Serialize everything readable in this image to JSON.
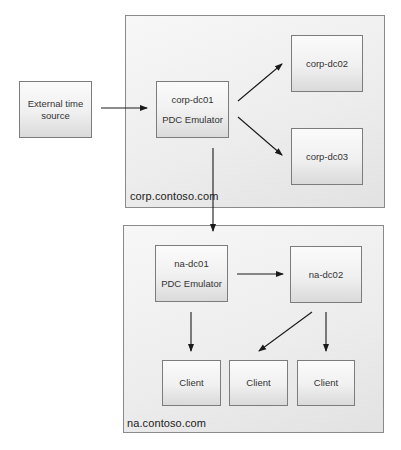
{
  "diagram": {
    "domains": [
      {
        "id": "corp",
        "label": "corp.contoso.com"
      },
      {
        "id": "na",
        "label": "na.contoso.com"
      }
    ],
    "nodes": {
      "external": {
        "line1": "External time",
        "line2": "source"
      },
      "corp_dc01": {
        "line1": "corp-dc01",
        "line2": "PDC Emulator"
      },
      "corp_dc02": {
        "line1": "corp-dc02"
      },
      "corp_dc03": {
        "line1": "corp-dc03"
      },
      "na_dc01": {
        "line1": "na-dc01",
        "line2": "PDC Emulator"
      },
      "na_dc02": {
        "line1": "na-dc02"
      },
      "client1": {
        "line1": "Client"
      },
      "client2": {
        "line1": "Client"
      },
      "client3": {
        "line1": "Client"
      }
    },
    "edges": [
      {
        "from": "External time source",
        "to": "corp-dc01"
      },
      {
        "from": "corp-dc01",
        "to": "corp-dc02"
      },
      {
        "from": "corp-dc01",
        "to": "corp-dc03"
      },
      {
        "from": "corp-dc01",
        "to": "na-dc01"
      },
      {
        "from": "na-dc01",
        "to": "na-dc02"
      },
      {
        "from": "na-dc01",
        "to": "Client (1)"
      },
      {
        "from": "na-dc02",
        "to": "Client (2)"
      },
      {
        "from": "na-dc02",
        "to": "Client (3)"
      }
    ],
    "colors": {
      "border": "#7c7c7c",
      "arrow": "#1a1a1a",
      "fill": "#efefef"
    }
  }
}
